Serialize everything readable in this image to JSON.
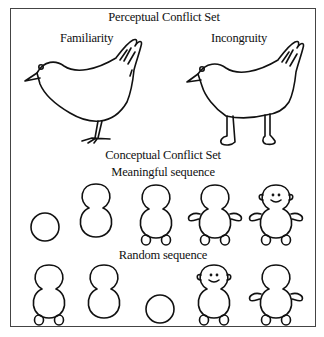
{
  "figure": {
    "title": "Perceptual Conflict Set",
    "panels": [
      {
        "label": "Familiarity",
        "image": "bird-with-hand-tail-normal-legs-icon"
      },
      {
        "label": "Incongruity",
        "image": "bird-with-hand-tail-human-legs-icon"
      }
    ],
    "conceptual_title": "Conceptual Conflict Set",
    "sequences": [
      {
        "label": "Meaningful sequence",
        "stages": [
          "circle",
          "figure-eight",
          "figure-eight-with-feet",
          "figure-eight-with-feet-and-arms",
          "full-figure-with-face-and-ears"
        ]
      },
      {
        "label": "Random sequence",
        "stages": [
          "figure-eight-with-feet",
          "figure-eight",
          "circle",
          "full-figure-with-face-and-ears",
          "figure-eight-with-feet-and-arms"
        ]
      }
    ]
  }
}
